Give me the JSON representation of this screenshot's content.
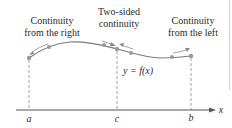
{
  "diagram": {
    "colors": {
      "curve": "#7a7a7a",
      "points": "#9a9a9a",
      "axis": "#555555",
      "dashed": "#888888",
      "text": "#2b2b2b"
    },
    "annotations": {
      "left": {
        "line1": "Continuity",
        "line2": "from the right"
      },
      "middle": {
        "line1": "Two-sided",
        "line2": "continuity"
      },
      "right": {
        "line1": "Continuity",
        "line2": "from the left"
      }
    },
    "function_label": "y = f(x)",
    "axis": {
      "x_label": "x",
      "ticks": [
        "a",
        "c",
        "b"
      ]
    }
  }
}
